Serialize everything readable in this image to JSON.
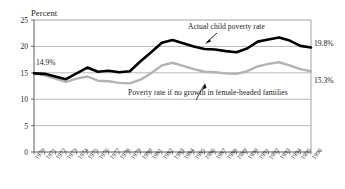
{
  "chart_data": {
    "type": "line",
    "title": "",
    "ylabel": "Percent",
    "xlabel": "",
    "ylim": [
      0,
      25
    ],
    "yticks": [
      "0",
      "5",
      "10",
      "15",
      "20",
      "25"
    ],
    "grid": true,
    "legend": "inline-annotations",
    "categories": [
      "1970",
      "1971",
      "1972",
      "1973",
      "1974",
      "1975",
      "1976",
      "1977",
      "1978",
      "1979",
      "1980",
      "1981",
      "1982",
      "1983",
      "1984",
      "1985",
      "1986",
      "1987",
      "1988",
      "1989",
      "1990",
      "1991",
      "1992",
      "1993",
      "1994",
      "1995",
      "1996"
    ],
    "series": [
      {
        "name": "Actual child poverty rate",
        "color": "#000000",
        "values": [
          14.9,
          14.8,
          14.3,
          13.8,
          14.9,
          16.0,
          15.2,
          15.4,
          15.1,
          15.3,
          17.2,
          18.9,
          20.7,
          21.2,
          20.6,
          20.0,
          19.5,
          19.4,
          19.1,
          18.9,
          19.6,
          20.9,
          21.3,
          21.7,
          21.1,
          20.1,
          19.8
        ],
        "end_label": "19.8%",
        "start_label": "14.9%"
      },
      {
        "name": "Poverty rate if no growth in female-headed families",
        "color": "#b3b3b3",
        "values": [
          14.9,
          14.5,
          13.9,
          13.3,
          13.9,
          14.3,
          13.5,
          13.4,
          13.1,
          13.0,
          13.7,
          14.9,
          16.4,
          16.9,
          16.3,
          15.7,
          15.2,
          15.1,
          14.9,
          14.8,
          15.3,
          16.2,
          16.7,
          17.0,
          16.4,
          15.7,
          15.3
        ],
        "end_label": "15.3%"
      }
    ],
    "annotations": [
      {
        "text": "Actual child poverty rate",
        "target_year": "1986"
      },
      {
        "text": "Poverty rate if no growth in female-headed families",
        "target_year": "1993"
      }
    ]
  },
  "labels": {
    "axis_title": "Percent",
    "annotation_actual": "Actual child poverty rate",
    "annotation_counterfactual": "Poverty rate if no growth in female-headed families",
    "start_value_actual": "14.9%",
    "end_value_actual": "19.8%",
    "end_value_counterfactual": "15.3%",
    "ytick_0": "0",
    "ytick_5": "5",
    "ytick_10": "10",
    "ytick_15": "15",
    "ytick_20": "20",
    "ytick_25": "25"
  }
}
